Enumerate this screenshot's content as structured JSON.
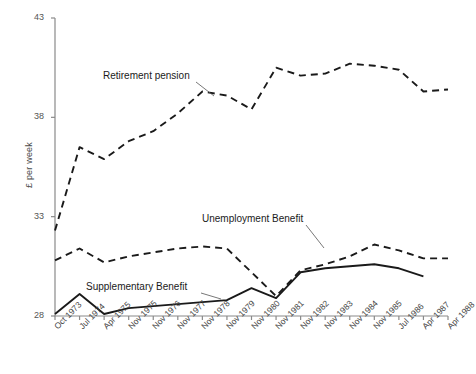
{
  "chart_data": {
    "type": "line",
    "title": "",
    "xlabel": "",
    "ylabel": "£ per week",
    "ylim": [
      28,
      43
    ],
    "yticks": [
      28,
      33,
      38,
      43
    ],
    "grid": false,
    "legend_position": "inline-annotations",
    "categories": [
      "Oct 1973",
      "Jul 1974",
      "Apr 1975",
      "Nov 1975",
      "Nov 1976",
      "Nov 1977",
      "Nov 1978",
      "Nov 1979",
      "Nov 1980",
      "Nov 1981",
      "Nov 1982",
      "Nov 1983",
      "Nov 1984",
      "Nov 1985",
      "Jul 1986",
      "Apr 1987",
      "Apr 1988"
    ],
    "series": [
      {
        "name": "Retirement pension",
        "style": "dashed",
        "values": [
          32.3,
          36.5,
          35.9,
          36.8,
          37.3,
          38.2,
          39.3,
          39.1,
          38.4,
          40.5,
          40.1,
          40.2,
          40.7,
          40.6,
          40.4,
          39.3,
          39.4
        ]
      },
      {
        "name": "Unemployment Benefit",
        "style": "dashed",
        "values": [
          30.8,
          31.4,
          30.7,
          31.0,
          31.2,
          31.4,
          31.5,
          31.4,
          30.2,
          29.0,
          30.3,
          30.6,
          31.0,
          31.6,
          31.3,
          30.9,
          30.9
        ]
      },
      {
        "name": "Supplementary Benefit",
        "style": "solid",
        "values": [
          28.1,
          29.1,
          28.1,
          28.4,
          28.5,
          28.6,
          28.7,
          28.8,
          29.4,
          28.9,
          30.2,
          30.4,
          30.5,
          30.6,
          30.4,
          30.0,
          null
        ]
      }
    ],
    "annotations": [
      {
        "text": "Retirement pension",
        "target_category": "Nov 1976"
      },
      {
        "text": "Unemployment Benefit",
        "target_category": "Nov 1982"
      },
      {
        "text": "Supplementary Benefit",
        "target_category": "Nov 1980"
      }
    ]
  },
  "axis": {
    "ytick_labels": [
      "43",
      "38",
      "33",
      "28"
    ],
    "ylabel_text": "£ per week"
  }
}
